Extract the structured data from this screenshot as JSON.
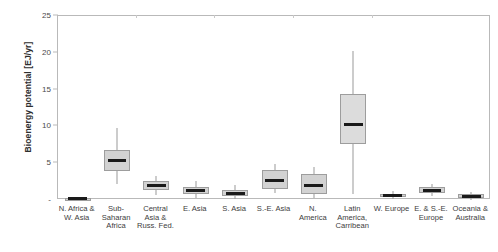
{
  "chart_data": {
    "type": "box",
    "title": "",
    "xlabel": "",
    "ylabel": "Bioenergy potential [EJ/yr]",
    "ylim": [
      0,
      25
    ],
    "ytick_labels": [
      "-",
      "5",
      "10",
      "15",
      "20",
      "25"
    ],
    "ytick_values": [
      0,
      5,
      10,
      15,
      20,
      25
    ],
    "grid": false,
    "legend": null,
    "categories": [
      "N. Africa & W. Asia",
      "Sub-Saharan Africa",
      "Central Asia & Russ. Fed.",
      "E. Asia",
      "S. Asia",
      "S.-E. Asia",
      "N. America",
      "Latin America, Carribean",
      "W. Europe",
      "E. & S.-E. Europe",
      "Oceania & Australia"
    ],
    "category_lines": [
      [
        "N. Africa &",
        "W. Asia"
      ],
      [
        "Sub-",
        "Saharan",
        "Africa"
      ],
      [
        "Central",
        "Asia &",
        "Russ. Fed."
      ],
      [
        "E. Asia"
      ],
      [
        "S. Asia"
      ],
      [
        "S.-E. Asia"
      ],
      [
        "N.",
        "America"
      ],
      [
        "Latin",
        "America,",
        "Carribean"
      ],
      [
        "W. Europe"
      ],
      [
        "E. & S.-E.",
        "Europe"
      ],
      [
        "Oceania &",
        "Australia"
      ]
    ],
    "boxes": [
      {
        "name": "N. Africa & W. Asia",
        "whisker_low": 0.0,
        "q1": 0.05,
        "median": 0.15,
        "q3": 0.3,
        "whisker_high": 0.45
      },
      {
        "name": "Sub-Saharan Africa",
        "whisker_low": 2.2,
        "q1": 3.9,
        "median": 5.4,
        "q3": 6.8,
        "whisker_high": 9.8
      },
      {
        "name": "Central Asia & Russ. Fed.",
        "whisker_low": 0.7,
        "q1": 1.4,
        "median": 2.0,
        "q3": 2.6,
        "whisker_high": 3.3
      },
      {
        "name": "E. Asia",
        "whisker_low": 0.3,
        "q1": 0.8,
        "median": 1.3,
        "q3": 1.8,
        "whisker_high": 2.6
      },
      {
        "name": "S. Asia",
        "whisker_low": 0.2,
        "q1": 0.5,
        "median": 0.9,
        "q3": 1.4,
        "whisker_high": 2.0
      },
      {
        "name": "S.-E. Asia",
        "whisker_low": 0.9,
        "q1": 1.5,
        "median": 2.7,
        "q3": 4.1,
        "whisker_high": 4.9
      },
      {
        "name": "N. America",
        "whisker_low": 0.3,
        "q1": 0.8,
        "median": 2.0,
        "q3": 3.5,
        "whisker_high": 4.5
      },
      {
        "name": "Latin America, Carribean",
        "whisker_low": 0.8,
        "q1": 7.6,
        "median": 10.3,
        "q3": 14.4,
        "whisker_high": 20.2
      },
      {
        "name": "W. Europe",
        "whisker_low": 0.1,
        "q1": 0.35,
        "median": 0.6,
        "q3": 0.85,
        "whisker_high": 1.2
      },
      {
        "name": "E. & S.-E. Europe",
        "whisker_low": 0.5,
        "q1": 0.9,
        "median": 1.3,
        "q3": 1.7,
        "whisker_high": 2.2
      },
      {
        "name": "Oceania & Australia",
        "whisker_low": 0.05,
        "q1": 0.25,
        "median": 0.5,
        "q3": 0.75,
        "whisker_high": 1.1
      }
    ],
    "colors": {
      "box_fill": "#d2d2d2",
      "box_border": "#9d9d9d",
      "median": "#1a1a1a",
      "whisker": "#9a9a9a",
      "frame": "#b9b9b9",
      "text": "#3a3a3a"
    }
  }
}
